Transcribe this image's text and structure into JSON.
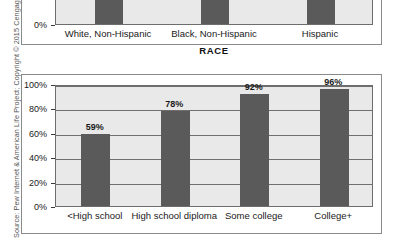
{
  "source_note": {
    "text": "Source: Pew Internet & American Life Project; Copyright © 2015 Cengage Learning®"
  },
  "colors": {
    "bar_fill": "#5a5a5a",
    "plot_background": "#e9e9e9",
    "gridline": "#6f6f6f",
    "frame_border": "#8a8a8a",
    "text": "#1a1a1a"
  },
  "chart_data": [
    {
      "id": "race-chart",
      "type": "bar",
      "title": "",
      "xlabel": "RACE",
      "ylabel": "",
      "categories": [
        "White, Non-Hispanic",
        "Black, Non-Hispanic",
        "Hispanic"
      ],
      "values": [
        null,
        null,
        null
      ],
      "value_labels": [
        "",
        "",
        ""
      ],
      "yticks": [
        "0%",
        "20%"
      ],
      "ytick_values": [
        0,
        20
      ],
      "ylim": [
        0,
        40
      ],
      "grid": true,
      "legend": "none",
      "note": "Only the bottom portion of this chart is visible; bars extend above the crop."
    },
    {
      "id": "education-chart",
      "type": "bar",
      "title": "",
      "xlabel": "",
      "ylabel": "",
      "categories": [
        "<High school",
        "High school diploma",
        "Some college",
        "College+"
      ],
      "values": [
        59,
        78,
        92,
        96
      ],
      "value_labels": [
        "59%",
        "78%",
        "92%",
        "96%"
      ],
      "yticks": [
        "0%",
        "20%",
        "40%",
        "60%",
        "80%",
        "100%"
      ],
      "ytick_values": [
        0,
        20,
        40,
        60,
        80,
        100
      ],
      "ylim": [
        0,
        100
      ],
      "grid": true,
      "legend": "none"
    }
  ]
}
